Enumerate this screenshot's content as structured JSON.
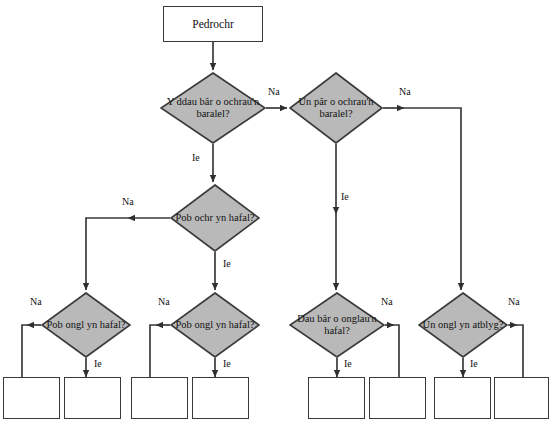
{
  "diagram": {
    "style": {
      "decision_fill": "#b9b9b9",
      "decision_stroke": "#3a3a3a",
      "process_fill": "#ffffff",
      "process_stroke": "#3a3a3a",
      "connector_stroke": "#3a3a3a",
      "text_color": "#111111",
      "background": "#ffffff"
    },
    "start": {
      "id": "start",
      "shape": "process",
      "label": "Pedrochr",
      "x": 163,
      "y": 6,
      "w": 100,
      "h": 36
    },
    "decisions": [
      {
        "id": "d1",
        "shape": "decision",
        "label": "Y ddau bâr o ochrau'n baralel?",
        "cx": 213,
        "cy": 108,
        "rx": 53,
        "ry": 36
      },
      {
        "id": "d2",
        "shape": "decision",
        "label": "Un pâr o ochrau'n baralel?",
        "cx": 336,
        "cy": 108,
        "rx": 47,
        "ry": 36
      },
      {
        "id": "d3",
        "shape": "decision",
        "label": "Pob ochr yn hafal?",
        "cx": 215,
        "cy": 218,
        "rx": 45,
        "ry": 34
      },
      {
        "id": "d4",
        "shape": "decision",
        "label": "Pob ongl yn hafal?",
        "cx": 86,
        "cy": 325,
        "rx": 45,
        "ry": 33
      },
      {
        "id": "d5",
        "shape": "decision",
        "label": "Pob ongl yn hafal?",
        "cx": 215,
        "cy": 325,
        "rx": 45,
        "ry": 33
      },
      {
        "id": "d6",
        "shape": "decision",
        "label": "Dau bâr o onglau'n hafal?",
        "cx": 337,
        "cy": 325,
        "rx": 48,
        "ry": 33
      },
      {
        "id": "d7",
        "shape": "decision",
        "label": "Un ongl yn atblyg?",
        "cx": 463,
        "cy": 325,
        "rx": 45,
        "ry": 33
      }
    ],
    "result_boxes": [
      {
        "id": "r1",
        "shape": "process",
        "label": "",
        "x": 3,
        "y": 377,
        "w": 57,
        "h": 42
      },
      {
        "id": "r2",
        "shape": "process",
        "label": "",
        "x": 64,
        "y": 377,
        "w": 57,
        "h": 42
      },
      {
        "id": "r3",
        "shape": "process",
        "label": "",
        "x": 131,
        "y": 377,
        "w": 57,
        "h": 42
      },
      {
        "id": "r4",
        "shape": "process",
        "label": "",
        "x": 192,
        "y": 377,
        "w": 57,
        "h": 42
      },
      {
        "id": "r5",
        "shape": "process",
        "label": "",
        "x": 308,
        "y": 377,
        "w": 57,
        "h": 42
      },
      {
        "id": "r6",
        "shape": "process",
        "label": "",
        "x": 369,
        "y": 377,
        "w": 57,
        "h": 42
      },
      {
        "id": "r7",
        "shape": "process",
        "label": "",
        "x": 434,
        "y": 377,
        "w": 57,
        "h": 42
      },
      {
        "id": "r8",
        "shape": "process",
        "label": "",
        "x": 494,
        "y": 377,
        "w": 55,
        "h": 42
      }
    ],
    "edge_labels": [
      {
        "id": "e1",
        "text": "Na",
        "x": 268,
        "y": 86,
        "from": "d1",
        "to": "d2"
      },
      {
        "id": "e2",
        "text": "Ie",
        "x": 192,
        "y": 152,
        "from": "d1",
        "to": "d3"
      },
      {
        "id": "e3",
        "text": "Na",
        "x": 399,
        "y": 86,
        "from": "d2",
        "to": "d7"
      },
      {
        "id": "e4",
        "text": "Ie",
        "x": 341,
        "y": 191,
        "from": "d2",
        "to": "d6"
      },
      {
        "id": "e5",
        "text": "Na",
        "x": 122,
        "y": 196,
        "from": "d3",
        "to": "d4"
      },
      {
        "id": "e6",
        "text": "Ie",
        "x": 223,
        "y": 258,
        "from": "d3",
        "to": "d5"
      },
      {
        "id": "e7",
        "text": "Na",
        "x": 30,
        "y": 296,
        "from": "d4",
        "to": "r1"
      },
      {
        "id": "e8",
        "text": "Ie",
        "x": 94,
        "y": 358,
        "from": "d4",
        "to": "r2"
      },
      {
        "id": "e9",
        "text": "Na",
        "x": 158,
        "y": 296,
        "from": "d5",
        "to": "r3"
      },
      {
        "id": "e10",
        "text": "Ie",
        "x": 223,
        "y": 358,
        "from": "d5",
        "to": "r4"
      },
      {
        "id": "e11",
        "text": "Na",
        "x": 381,
        "y": 296,
        "from": "d6",
        "to": "r6"
      },
      {
        "id": "e12",
        "text": "Ie",
        "x": 344,
        "y": 358,
        "from": "d6",
        "to": "r5"
      },
      {
        "id": "e13",
        "text": "Na",
        "x": 508,
        "y": 296,
        "from": "d7",
        "to": "r8"
      },
      {
        "id": "e14",
        "text": "Ie",
        "x": 470,
        "y": 358,
        "from": "d7",
        "to": "r7"
      }
    ]
  }
}
